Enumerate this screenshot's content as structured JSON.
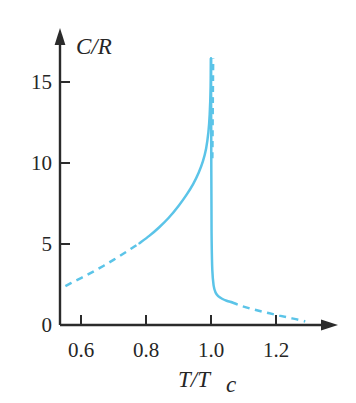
{
  "figure": {
    "name": "heat-capacity-lambda-transition",
    "background_color": "#ffffff",
    "axis_color": "#2b2b2b",
    "curve_color": "#5BC4E8"
  },
  "axis_titles": {
    "y": "C/R",
    "x_main": "T/T",
    "x_subscript": "c"
  },
  "y_ticks": [
    {
      "label": "0",
      "value": 0
    },
    {
      "label": "5",
      "value": 5
    },
    {
      "label": "10",
      "value": 10
    },
    {
      "label": "15",
      "value": 15
    }
  ],
  "x_ticks": [
    {
      "label": "0.6",
      "value": 0.6
    },
    {
      "label": "0.8",
      "value": 0.8
    },
    {
      "label": "1.0",
      "value": 1.0
    },
    {
      "label": "1.2",
      "value": 1.2
    }
  ],
  "chart_data": {
    "type": "line",
    "title": "",
    "subtitle": "",
    "xlabel": "T/Tc",
    "ylabel": "C/R",
    "xlim": [
      0.52,
      1.31
    ],
    "ylim": [
      0,
      17.5
    ],
    "grid": false,
    "legend": "none",
    "line_color": "#5BC4E8",
    "series": [
      {
        "name": "below-Tc-extrapolated-dashed",
        "style": "dashed",
        "x": [
          0.552,
          0.58,
          0.61,
          0.64,
          0.67,
          0.7,
          0.73,
          0.755,
          0.78
        ],
        "values": [
          2.4,
          2.7,
          3.0,
          3.32,
          3.66,
          4.02,
          4.4,
          4.72,
          5.05
        ]
      },
      {
        "name": "below-Tc-measured-solid",
        "style": "solid",
        "x": [
          0.78,
          0.81,
          0.84,
          0.87,
          0.9,
          0.925,
          0.945,
          0.962,
          0.975,
          0.985,
          0.992,
          0.996,
          0.999,
          1.0
        ],
        "values": [
          5.05,
          5.5,
          6.02,
          6.62,
          7.35,
          8.05,
          8.7,
          9.4,
          10.1,
          10.9,
          11.9,
          13.0,
          14.7,
          16.45
        ]
      },
      {
        "name": "near-Tc-steep-dashed-branch",
        "style": "dashed",
        "x": [
          1.004,
          1.0045,
          1.005,
          1.0055,
          1.006,
          1.0065
        ],
        "values": [
          10.3,
          11.5,
          12.8,
          14.1,
          15.3,
          16.45
        ]
      },
      {
        "name": "above-Tc-solid-drop",
        "style": "solid",
        "x": [
          1.0,
          1.0005,
          1.001,
          1.0015,
          1.002,
          1.004,
          1.008,
          1.014,
          1.022,
          1.034,
          1.048,
          1.062
        ],
        "values": [
          16.45,
          13.0,
          9.5,
          7.0,
          5.2,
          3.4,
          2.45,
          2.0,
          1.78,
          1.62,
          1.5,
          1.42
        ]
      },
      {
        "name": "above-Tc-tail-dashed",
        "style": "dashed",
        "x": [
          1.062,
          1.09,
          1.12,
          1.15,
          1.18,
          1.21,
          1.24,
          1.27,
          1.29
        ],
        "values": [
          1.42,
          1.2,
          1.02,
          0.86,
          0.72,
          0.58,
          0.45,
          0.32,
          0.22
        ]
      }
    ],
    "annotations": [
      {
        "text": "peak at T/Tc = 1.0, C/R = 16.5"
      }
    ]
  }
}
